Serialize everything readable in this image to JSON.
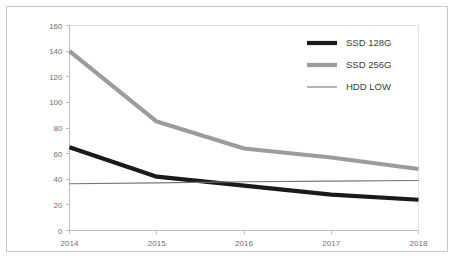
{
  "chart_data": {
    "type": "line",
    "title": "",
    "subtitle": "",
    "xlabel": "",
    "ylabel": "",
    "categories": [
      "2014",
      "2015",
      "2016",
      "2017",
      "2018"
    ],
    "x": [
      2014,
      2015,
      2016,
      2017,
      2018
    ],
    "xlim": [
      2014,
      2018
    ],
    "ylim": [
      0,
      160
    ],
    "yticks": [
      0,
      20,
      40,
      60,
      80,
      100,
      120,
      140,
      160
    ],
    "xticks": [
      "2014",
      "2015",
      "2016",
      "2017",
      "2018"
    ],
    "grid": false,
    "legend_position": "top-right",
    "series": [
      {
        "name": "SSD 128G",
        "values": [
          65,
          42,
          35,
          28,
          24
        ],
        "color": "#1a1a1a",
        "width": 4.2
      },
      {
        "name": "SSD 256G",
        "values": [
          140,
          85,
          64,
          57,
          48
        ],
        "color": "#9c9c9c",
        "width": 4.2
      },
      {
        "name": "HDD LOW",
        "values": [
          36.5,
          37.2,
          38,
          38.5,
          39
        ],
        "color": "#767676",
        "width": 1.1
      }
    ]
  },
  "legend": {
    "items": [
      {
        "label": "SSD 128G"
      },
      {
        "label": "SSD 256G"
      },
      {
        "label": "HDD LOW"
      }
    ]
  },
  "axes": {
    "y_tick_labels": [
      "160",
      "140",
      "120",
      "100",
      "80",
      "60",
      "40",
      "20",
      "0"
    ],
    "x_tick_labels": [
      "2014",
      "2015",
      "2016",
      "2017",
      "2018"
    ]
  },
  "colors": {
    "frame_border": "#c9c9c9",
    "axis": "#bdbdbd",
    "tick_text": "#6f6f6f",
    "legend_text": "#3a3a3a",
    "background": "#ffffff"
  }
}
